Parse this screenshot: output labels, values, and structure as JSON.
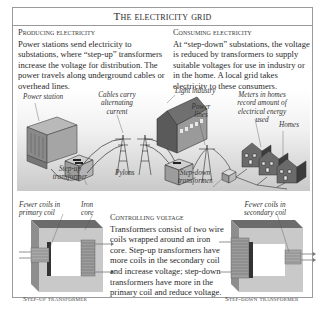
{
  "title": "The electricity grid",
  "producing": {
    "heading": "Producing electricity",
    "body": "Power stations send electricity to substations, where “step-up” transformers increase the voltage for distribution. The power travels along underground cables or overhead lines."
  },
  "consuming": {
    "heading": "Consuming electricity",
    "body": "At “step-down” substations, the voltage is reduced by transformers to supply suitable voltages for use in industry or in the home. A local grid takes electricity to these consumers."
  },
  "illustration": {
    "labels": {
      "power_station": "Power station",
      "cables": "Cables carry alternating current",
      "pylons": "Pylons",
      "step_up": "Step-up transformer",
      "light_industry": "Light industry",
      "power_lines": "Power lines",
      "step_down": "Step-down transformer",
      "meters": "Meters in homes record amount of electrical energy used",
      "homes": "Homes"
    }
  },
  "controlling": {
    "heading": "Controlling voltage",
    "body": "Transformers consist of two wire coils wrapped around an iron core. Step-up transformers have more coils in the secondary coil and increase voltage; step-down transformers have more in the primary coil and reduce voltage."
  },
  "step_up_diagram": {
    "label_coils": "Fewer coils in primary coil",
    "label_core": "Iron core",
    "caption": "Step-up transformer"
  },
  "step_down_diagram": {
    "label_coils": "Fewer coils in secondary coil",
    "caption": "Step-down transformer"
  }
}
